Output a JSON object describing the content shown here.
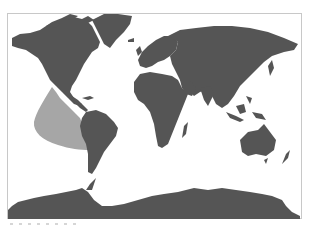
{
  "map": {
    "projection": "world",
    "land_color": "#555555",
    "range_color": "#a6a6a6",
    "ocean_color": "#ffffff",
    "frame_color": "#c8c8c8",
    "highlighted_region": "eastern-tropical-pacific-range",
    "continents": [
      "North America",
      "Greenland",
      "South America",
      "Europe",
      "Africa",
      "Asia",
      "Australia",
      "Antarctica"
    ]
  }
}
